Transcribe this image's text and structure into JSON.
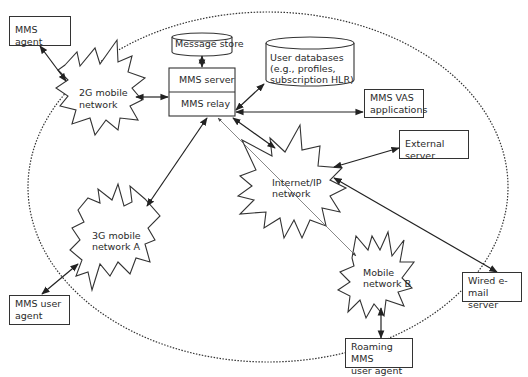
{
  "diagram": {
    "nodes": {
      "mms_agent": "MMS agent",
      "message_store": "Message store",
      "user_databases": [
        "User databases",
        "(e.g., profiles,",
        "subscription HLR)"
      ],
      "mms_server": "MMS server",
      "mms_relay": "MMS relay",
      "mms_vas": [
        "MMS VAS",
        "applications"
      ],
      "external_server": "External server",
      "network_2g": [
        "2G mobile",
        "network"
      ],
      "network_internet": [
        "Internet/IP",
        "network"
      ],
      "network_3g": [
        "3G mobile",
        "network A"
      ],
      "network_mobile_b": [
        "Mobile",
        "network B"
      ],
      "mms_user_agent": [
        "MMS user",
        "agent"
      ],
      "wired_email": [
        "Wired e-mail",
        "server"
      ],
      "roaming_agent": [
        "Roaming MMS",
        "user agent"
      ]
    },
    "edges": [
      {
        "from": "MMS agent",
        "to": "2G mobile network",
        "type": "bidirectional"
      },
      {
        "from": "2G mobile network",
        "to": "MMS relay",
        "type": "bidirectional"
      },
      {
        "from": "Message store",
        "to": "MMS server",
        "type": "bidirectional"
      },
      {
        "from": "MMS relay",
        "to": "User databases",
        "type": "bidirectional"
      },
      {
        "from": "MMS relay",
        "to": "MMS VAS applications",
        "type": "bidirectional"
      },
      {
        "from": "MMS relay",
        "to": "Internet/IP network",
        "type": "bidirectional"
      },
      {
        "from": "MMS relay",
        "to": "3G mobile network A",
        "type": "bidirectional"
      },
      {
        "from": "MMS relay",
        "to": "Mobile network B",
        "type": "bidirectional-thin"
      },
      {
        "from": "External server",
        "to": "Internet/IP network",
        "type": "bidirectional"
      },
      {
        "from": "Internet/IP network",
        "to": "Wired e-mail server",
        "type": "bidirectional"
      },
      {
        "from": "3G mobile network A",
        "to": "MMS user agent",
        "type": "bidirectional"
      },
      {
        "from": "Mobile network B",
        "to": "Roaming MMS user agent",
        "type": "bidirectional"
      }
    ]
  }
}
